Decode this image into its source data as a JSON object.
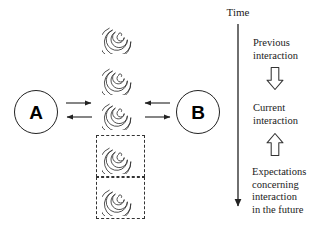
{
  "diagram": {
    "background_color": "#ffffff",
    "stroke_color": "#222222",
    "actors": [
      {
        "id": "a",
        "label": "A"
      },
      {
        "id": "b",
        "label": "B"
      }
    ],
    "time_axis": {
      "label": "Time",
      "direction": "downward"
    },
    "exchange_arrows": [
      {
        "id": "a-to-center",
        "direction": "right",
        "from": "A",
        "to": "current-interaction"
      },
      {
        "id": "center-to-a",
        "direction": "left",
        "from": "current-interaction",
        "to": "A"
      },
      {
        "id": "b-to-center",
        "direction": "left",
        "from": "B",
        "to": "current-interaction"
      },
      {
        "id": "center-to-b",
        "direction": "right",
        "from": "current-interaction",
        "to": "B"
      }
    ],
    "interaction_nodes": [
      {
        "id": "past-2",
        "kind": "spiral",
        "boxed": false
      },
      {
        "id": "past-1",
        "kind": "spiral",
        "boxed": false
      },
      {
        "id": "current",
        "kind": "spiral",
        "boxed": false
      },
      {
        "id": "future-1",
        "kind": "spiral",
        "boxed": true
      },
      {
        "id": "future-2",
        "kind": "spiral",
        "boxed": true
      }
    ],
    "notes": {
      "previous": "Previous\ninteraction",
      "current": "Current\ninteraction",
      "future": "Expectations\nconcerning\ninteraction\nin the future"
    },
    "block_arrows": [
      {
        "id": "down",
        "direction": "down",
        "fill": "#ffffff",
        "stroke": "#333333"
      },
      {
        "id": "up",
        "direction": "up",
        "fill": "#ffffff",
        "stroke": "#333333"
      }
    ]
  }
}
